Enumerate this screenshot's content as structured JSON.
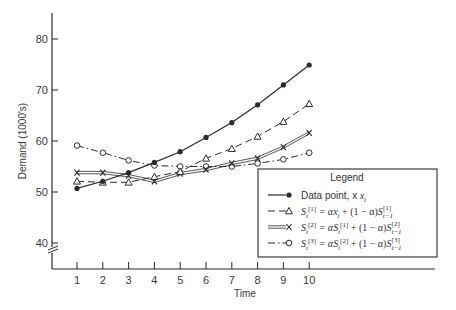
{
  "chart_data": {
    "type": "line",
    "title": "",
    "xlabel": "Time",
    "ylabel": "Demand (1000's)",
    "x": [
      1,
      2,
      3,
      4,
      5,
      6,
      7,
      8,
      9,
      10
    ],
    "xticks": [
      "1",
      "2",
      "3",
      "4",
      "5",
      "6",
      "7",
      "8",
      "9",
      "10"
    ],
    "yticks": [
      "40",
      "50",
      "60",
      "70",
      "80"
    ],
    "ylim": [
      40,
      80
    ],
    "y_axis_break": true,
    "grid": false,
    "legend_position": "lower right",
    "legend_title": "Legend",
    "series": [
      {
        "name": "Data point, x_t",
        "legend_label": "Data point, x",
        "legend_sub": "t",
        "marker": "filled-circle",
        "line": "solid",
        "values": [
          50.7,
          52.1,
          53.8,
          55.8,
          57.9,
          60.7,
          63.6,
          67.1,
          71.0,
          74.9
        ]
      },
      {
        "name": "S_t[1] = αx_t + (1 − α)S_t−1[1]",
        "legend_label": "S_t^[1] = αx_t + (1 − α)S_t−1^[1]",
        "marker": "open-triangle",
        "line": "dashed",
        "values": [
          52.1,
          51.9,
          51.9,
          53.0,
          54.0,
          56.6,
          58.5,
          60.9,
          63.8,
          67.3
        ]
      },
      {
        "name": "S_t[2] = αS_t[1] + (1 − α)S_t−1[2]",
        "legend_label": "S_t^[2] = αS_t^[1] + (1 − α)S_t−1^[2]",
        "marker": "x",
        "line": "double",
        "values": [
          53.8,
          53.8,
          53.2,
          52.1,
          53.6,
          54.4,
          55.6,
          56.6,
          58.8,
          61.6
        ]
      },
      {
        "name": "S_t[3] = αS_t[2] + (1 − α)S_t−1[3]",
        "legend_label": "S_t^[3] = αS_t^[2] + (1 − α)S_t−1^[3]",
        "marker": "open-circle",
        "line": "dash-dot",
        "values": [
          59.1,
          57.7,
          56.2,
          55.2,
          55.0,
          55.0,
          55.0,
          55.6,
          56.4,
          57.7
        ]
      }
    ]
  },
  "colors": {
    "ink": "#2b2b2b",
    "text": "#3a3a3a",
    "background": "#ffffff"
  }
}
